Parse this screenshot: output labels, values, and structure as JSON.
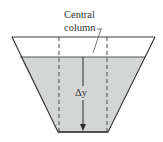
{
  "diagram": {
    "labels": {
      "central_line1": "Central",
      "central_line2": "column",
      "delta_y": "Δy"
    },
    "colors": {
      "outline": "#3a3a3a",
      "fluid": "#d4d6d6",
      "dashed": "#4a4a4a",
      "background": "#ffffff"
    },
    "shapes": {
      "container": "trapezoidal vessel, wide top, narrow bottom",
      "fluid": "partially filled, surface below rim",
      "central_column": "dashed vertical lines above bottom edge",
      "arrow": "downward arrow from fluid surface to bottom labeled Δy"
    }
  }
}
